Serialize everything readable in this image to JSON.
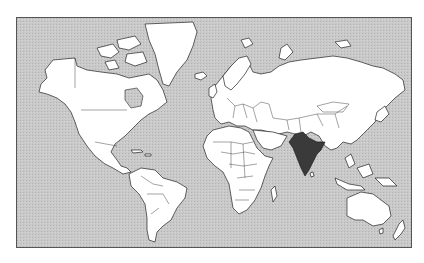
{
  "map": {
    "projection": "mercator-world",
    "highlighted_country": "India",
    "colors": {
      "ocean": "#c4c4c4",
      "land": "#ffffff",
      "border": "#222222",
      "highlight": "#3a3a3a",
      "frame": "#555555"
    }
  }
}
